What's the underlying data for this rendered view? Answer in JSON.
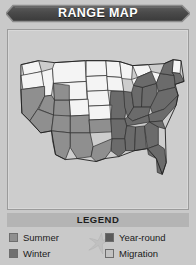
{
  "widget": {
    "name": "range-map",
    "background_color": "#c9c9c9"
  },
  "header": {
    "title": "RANGE MAP",
    "banner_color": "#4a4a4a",
    "text_color": "#ffffff"
  },
  "map": {
    "region": "United States",
    "panel_color": "#cdcdcd",
    "border_color": "#9b9b9b",
    "outline_color": "#2b2b2b",
    "fills": {
      "unshaded": "#f4f4f4",
      "summer": "#8f8f8f",
      "winter": "#707070",
      "year_round": "#5a5a5a",
      "migration": "#b8b8b8"
    }
  },
  "legend": {
    "title": "LEGEND",
    "title_bar_color": "#b4b4b4",
    "bird_icon": "flying-bird-icon",
    "items": [
      {
        "label": "Summer",
        "color": "#8f8f8f",
        "column": "left"
      },
      {
        "label": "Winter",
        "color": "#707070",
        "column": "left"
      },
      {
        "label": "Year-round",
        "color": "#5a5a5a",
        "column": "right"
      },
      {
        "label": "Migration",
        "color": "#c2c2c2",
        "column": "right"
      }
    ]
  }
}
